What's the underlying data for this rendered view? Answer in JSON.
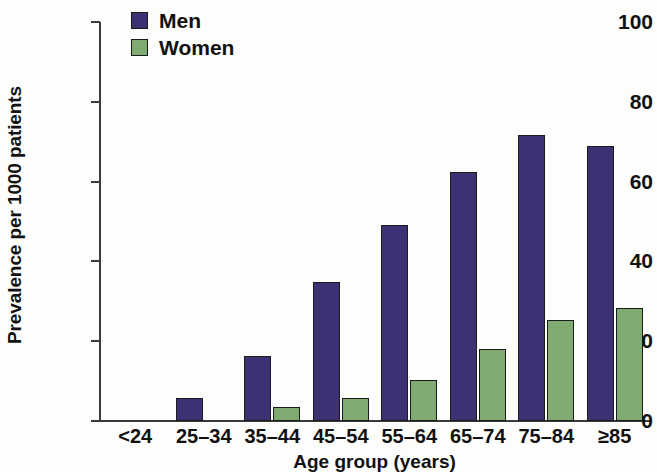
{
  "chart_data": {
    "type": "bar",
    "title": "",
    "xlabel": "Age group (years)",
    "ylabel": "Prevalence per 1000 patients",
    "categories": [
      "<24",
      "25–34",
      "35–44",
      "45–54",
      "55–64",
      "65–74",
      "75–84",
      "≥85"
    ],
    "series": [
      {
        "name": "Men",
        "color": "#3d3073",
        "values": [
          0,
          5.8,
          16.2,
          34.8,
          49.2,
          62.4,
          71.8,
          68.9
        ]
      },
      {
        "name": "Women",
        "color": "#7fab73",
        "values": [
          0,
          0,
          3.6,
          5.8,
          10.4,
          18.0,
          25.2,
          28.2
        ]
      }
    ],
    "ylim": [
      0,
      100
    ],
    "yticks": [
      0,
      20,
      40,
      60,
      80,
      100
    ],
    "ytick_labels": [
      "0",
      "20",
      "40",
      "60",
      "80",
      "100"
    ],
    "grid": false,
    "legend_position": "top-left"
  },
  "legend": {
    "items": [
      {
        "label": "Men",
        "color": "#3d3073"
      },
      {
        "label": "Women",
        "color": "#7fab73"
      }
    ]
  }
}
